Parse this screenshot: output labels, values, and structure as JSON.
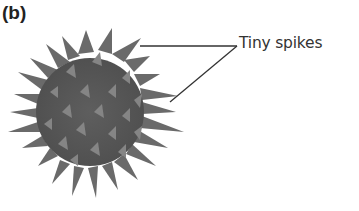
{
  "figure": {
    "panel_label": "(b)",
    "callout_label": "Tiny spikes",
    "colors": {
      "body": "#5a5a5a",
      "spike": "#6e6e6e",
      "highlight": "#8a8a8a",
      "leader_line": "#333333",
      "text": "#333333"
    }
  }
}
